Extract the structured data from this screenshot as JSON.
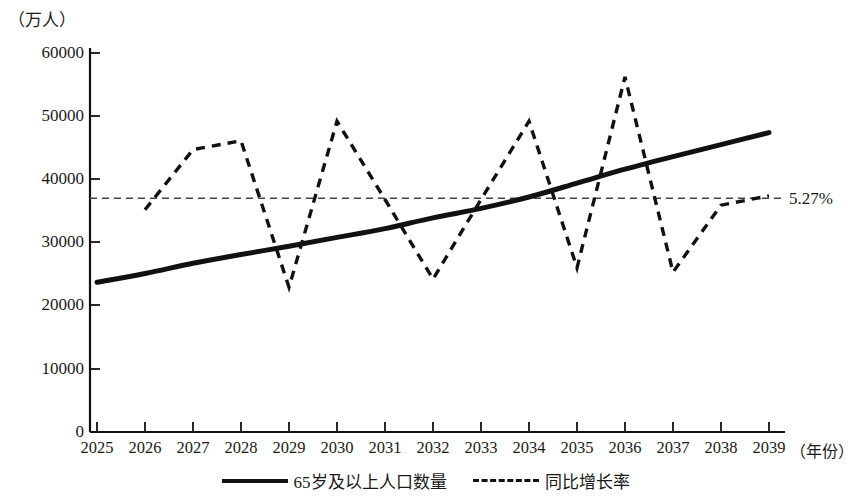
{
  "chart_data": {
    "type": "line",
    "title": "",
    "ylabel": "（万人）",
    "xlabel": "（年份）",
    "x": [
      "2025",
      "2026",
      "2027",
      "2028",
      "2029",
      "2030",
      "2031",
      "2032",
      "2033",
      "2034",
      "2035",
      "2036",
      "2037",
      "2038",
      "2039"
    ],
    "ylim": [
      0,
      60000
    ],
    "yticks": [
      "0",
      "10000",
      "20000",
      "30000",
      "40000",
      "50000",
      "60000"
    ],
    "ytick_values": [
      0,
      10000,
      20000,
      30000,
      40000,
      50000,
      60000
    ],
    "grid": false,
    "legend_position": "bottom",
    "series": [
      {
        "name": "65岁及以上人口数量",
        "style": "solid",
        "color": "#111111",
        "values": [
          23700,
          25100,
          26700,
          28100,
          29400,
          30800,
          32200,
          33900,
          35400,
          37200,
          39400,
          41600,
          43600,
          45500,
          47400
        ]
      },
      {
        "name": "同比增长率",
        "style": "dashed",
        "color": "#111111",
        "values": [
          null,
          35200,
          44700,
          46100,
          22900,
          49200,
          36800,
          24200,
          36800,
          49200,
          26000,
          56200,
          25300,
          35900,
          37400
        ]
      }
    ],
    "annotations": [
      {
        "name": "reference-line",
        "label": "5.27%",
        "value": 37000,
        "style": "dashed",
        "orientation": "horizontal"
      }
    ]
  },
  "axis": {
    "unit_label": "（万人）",
    "x_title": "（年份）",
    "y_labels": [
      "60000",
      "50000",
      "40000",
      "30000",
      "20000",
      "10000",
      "0"
    ],
    "x_labels": [
      "2025",
      "2026",
      "2027",
      "2028",
      "2029",
      "2030",
      "2031",
      "2032",
      "2033",
      "2034",
      "2035",
      "2036",
      "2037",
      "2038",
      "2039"
    ]
  },
  "legend": {
    "items": [
      {
        "label": "65岁及以上人口数量",
        "style": "solid"
      },
      {
        "label": "同比增长率",
        "style": "dashed"
      }
    ]
  },
  "reference": {
    "label": "5.27%"
  }
}
